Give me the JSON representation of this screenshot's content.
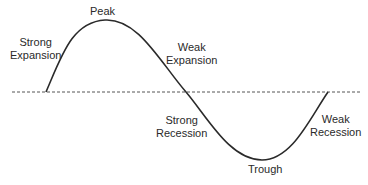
{
  "diagram": {
    "type": "business-cycle",
    "colors": {
      "curve": "#2a2a2a",
      "baseline": "#555555",
      "text": "#2a2a2a",
      "background": "#ffffff"
    },
    "labels": {
      "peak": {
        "text": "Peak"
      },
      "trough": {
        "text": "Trough"
      },
      "strong_expansion": {
        "line1": "Strong",
        "line2": "Expansion"
      },
      "weak_expansion": {
        "line1": "Weak",
        "line2": "Expansion"
      },
      "strong_recession": {
        "line1": "Strong",
        "line2": "Recession"
      },
      "weak_recession": {
        "line1": "Weak",
        "line2": "Recession"
      }
    }
  }
}
